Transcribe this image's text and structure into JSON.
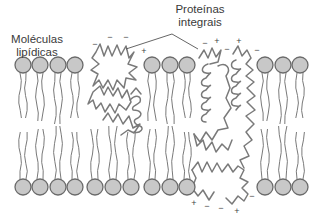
{
  "diagram": {
    "labels": {
      "lipid_line1": "Moléculas",
      "lipid_line2": "lipídicas",
      "protein_line1": "Proteínas",
      "protein_line2": "integrais"
    },
    "colors": {
      "head_fill": "#c8c8c8",
      "head_stroke": "#6a6a6a",
      "line": "#7a7a7a",
      "text": "#3a3a3a"
    },
    "bilayer": {
      "top_row_y": 65,
      "bottom_row_y": 187,
      "head_radius": 8,
      "top_heads_x": [
        23,
        40,
        58,
        75,
        152,
        170,
        187,
        265,
        283,
        300
      ],
      "bottom_heads_x": [
        23,
        40,
        58,
        75,
        95,
        113,
        131,
        152,
        170,
        187,
        265,
        283,
        300
      ]
    },
    "charges": {
      "top": [
        {
          "x": 95,
          "y": 47,
          "sign": "−"
        },
        {
          "x": 110,
          "y": 40,
          "sign": "−"
        },
        {
          "x": 126,
          "y": 40,
          "sign": "−"
        },
        {
          "x": 144,
          "y": 54,
          "sign": "+"
        },
        {
          "x": 205,
          "y": 46,
          "sign": "−"
        },
        {
          "x": 217,
          "y": 44,
          "sign": "+"
        },
        {
          "x": 227,
          "y": 52,
          "sign": "−"
        },
        {
          "x": 239,
          "y": 44,
          "sign": "+"
        },
        {
          "x": 257,
          "y": 53,
          "sign": "−"
        }
      ],
      "bottom": [
        {
          "x": 194,
          "y": 206,
          "sign": "+"
        },
        {
          "x": 207,
          "y": 209,
          "sign": "−"
        },
        {
          "x": 221,
          "y": 211,
          "sign": "−"
        },
        {
          "x": 237,
          "y": 214,
          "sign": "+"
        },
        {
          "x": 252,
          "y": 199,
          "sign": "−"
        }
      ]
    }
  }
}
